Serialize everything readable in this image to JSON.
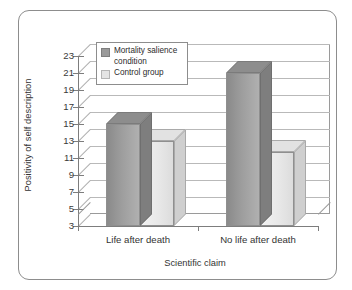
{
  "chart_data": {
    "type": "bar",
    "title": "",
    "subtitle": "",
    "xlabel": "Scientific claim",
    "ylabel": "Positivity of self description",
    "categories": [
      "Life after death",
      "No life after death"
    ],
    "series": [
      {
        "name": "Mortality salience condition",
        "values": [
          15,
          21
        ],
        "color": "#9a9a9a"
      },
      {
        "name": "Control group",
        "values": [
          13,
          11.7
        ],
        "color": "#e4e4e4"
      }
    ],
    "ylim": [
      3,
      23
    ],
    "ytick_step": 2,
    "yticks": [
      23,
      21,
      19,
      17,
      15,
      13,
      11,
      9,
      7,
      5,
      3
    ],
    "grid": true,
    "legend_position": "top-left-inside",
    "style": "3d-clustered-bar-grayscale"
  },
  "legend": {
    "entries": [
      {
        "label_line1": "Mortality salience",
        "label_line2": "condition",
        "swatch": "dark-gray-swatch"
      },
      {
        "label_line1": "Control group",
        "label_line2": "",
        "swatch": "light-gray-swatch"
      }
    ]
  },
  "frame": {
    "border_color": "#8d8d8d"
  }
}
